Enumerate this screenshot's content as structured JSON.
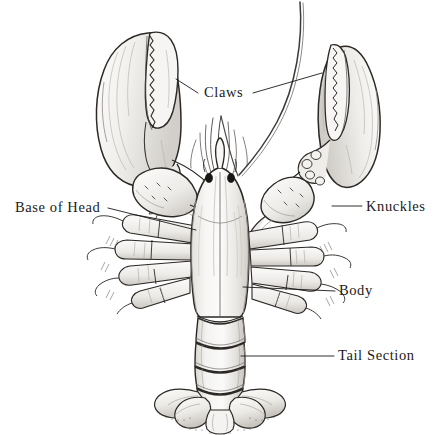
{
  "figure": {
    "view": "dorsal",
    "style": "pen-and-ink line drawing, grayscale shading",
    "background_color": "#ffffff",
    "ink_color": "#1a1a1a",
    "shade_light": "#f2f1ef",
    "shade_mid": "#d8d6d2",
    "shade_dark": "#a9a6a1"
  },
  "labels": [
    {
      "id": "claws",
      "text": "Claws",
      "text_x": 204,
      "text_y": 85,
      "leaders": [
        {
          "from_x": 198,
          "from_y": 93,
          "to_x": 176,
          "to_y": 79
        },
        {
          "from_x": 253,
          "from_y": 93,
          "to_x": 322,
          "to_y": 73
        }
      ]
    },
    {
      "id": "knuckles",
      "text": "Knuckles",
      "text_x": 366,
      "text_y": 199,
      "leaders": [
        {
          "from_x": 362,
          "from_y": 206,
          "to_x": 332,
          "to_y": 206
        }
      ]
    },
    {
      "id": "base-of-head",
      "text": "Base of Head",
      "text_x": 15,
      "text_y": 200,
      "leaders": [
        {
          "from_x": 108,
          "from_y": 208,
          "to_x": 196,
          "to_y": 230
        }
      ]
    },
    {
      "id": "body",
      "text": "Body",
      "text_x": 339,
      "text_y": 283,
      "leaders": [
        {
          "from_x": 335,
          "from_y": 291,
          "to_x": 243,
          "to_y": 287
        }
      ]
    },
    {
      "id": "tail-section",
      "text": "Tail Section",
      "text_x": 338,
      "text_y": 348,
      "leaders": [
        {
          "from_x": 334,
          "from_y": 356,
          "to_x": 241,
          "to_y": 356
        }
      ]
    }
  ],
  "anatomy_parts": [
    "left-crusher-claw",
    "right-cutter-claw",
    "left-knuckle",
    "right-knuckle",
    "carapace",
    "antennae",
    "eyes",
    "walking-legs",
    "tail-segments",
    "tail-fan"
  ]
}
